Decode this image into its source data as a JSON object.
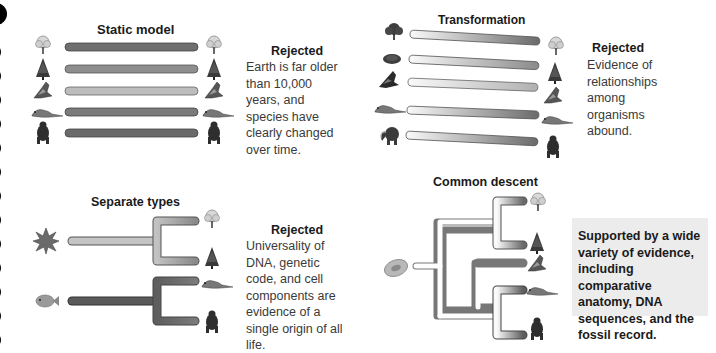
{
  "panels": {
    "static": {
      "title": "Static model",
      "verdict": "Rejected",
      "reason": "Earth is far older than 10,000 years, and species have clearly changed over time.",
      "organisms_left": [
        "deciduous-tree",
        "conifer",
        "moth",
        "lizard",
        "gorilla"
      ],
      "organisms_right": [
        "deciduous-tree",
        "conifer",
        "moth",
        "lizard",
        "gorilla"
      ]
    },
    "transformation": {
      "title": "Transformation",
      "verdict": "Rejected",
      "reason": "Evidence of relationships among organisms abound.",
      "organisms_left": [
        "shrub",
        "moss-mound",
        "moth-dark",
        "lizard",
        "mammoth"
      ],
      "organisms_right": [
        "deciduous-tree",
        "conifer",
        "moth",
        "lizard",
        "gorilla"
      ]
    },
    "separate": {
      "title": "Separate types",
      "verdict": "Rejected",
      "reason": "Universality of DNA, genetic code, and cell components are evidence of a single origin of all life.",
      "organisms_left": [
        "algae",
        "fish"
      ],
      "organisms_right": [
        "deciduous-tree",
        "conifer",
        "lizard",
        "gorilla"
      ]
    },
    "common": {
      "title": "Common descent",
      "verdict": "Supported by a wide variety of evidence, including comparative anatomy, DNA sequences, and the fossil record.",
      "organisms_left": [
        "single-cell"
      ],
      "organisms_right": [
        "deciduous-tree",
        "conifer",
        "moth",
        "lizard",
        "gorilla"
      ]
    }
  },
  "colors": {
    "bar_dark": "#6e6e6e",
    "bar_mid": "#8c8c8c",
    "bar_light": "#b4b4b4",
    "support_bg": "#ececec"
  }
}
